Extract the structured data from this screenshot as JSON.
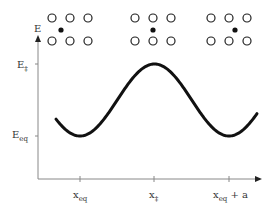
{
  "axes": {
    "y_label": "E",
    "x_label": "",
    "y_ticks": [
      {
        "main": "E",
        "sub": "‡",
        "level": "barrier"
      },
      {
        "main": "E",
        "sub": "eq",
        "level": "equilibrium"
      }
    ],
    "x_ticks": [
      {
        "main": "x",
        "sub": "eq",
        "suffix": ""
      },
      {
        "main": "x",
        "sub": "‡",
        "suffix": ""
      },
      {
        "main": "x",
        "sub": "eq",
        "suffix": " + a"
      }
    ]
  },
  "lattice_insets": [
    {
      "position": "x_eq",
      "interstitial": "near-left",
      "description": "atom at equilibrium site"
    },
    {
      "position": "x_ddagger",
      "interstitial": "center",
      "description": "atom at saddle point"
    },
    {
      "position": "x_eq + a",
      "interstitial": "near-right",
      "description": "atom at next equilibrium site"
    }
  ],
  "chart_data": {
    "type": "line",
    "title": "",
    "xlabel": "",
    "ylabel": "E",
    "x_tick_labels": [
      "x_eq",
      "x_‡",
      "x_eq + a"
    ],
    "y_tick_labels": [
      "E_‡",
      "E_eq"
    ],
    "series": [
      {
        "name": "energy",
        "description": "periodic energy profile: minimum at x_eq, maximum E_‡ at x_‡, minimum E_eq at x_eq + a",
        "x": [
          -0.3,
          0.0,
          0.5,
          1.0,
          1.15
        ],
        "y": [
          0.3,
          0.0,
          1.0,
          0.0,
          0.2
        ]
      }
    ],
    "grid": false
  }
}
